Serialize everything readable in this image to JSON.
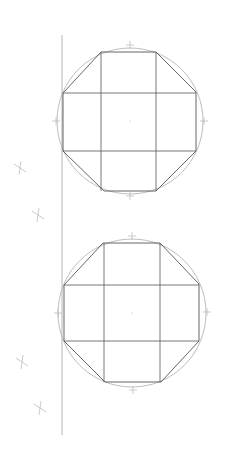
{
  "drawing": {
    "background": "#ffffff",
    "stroke_dark": "#555555",
    "stroke_light": "#b5b5b5",
    "baseline": {
      "x": 62,
      "y1": 35,
      "y2": 435
    },
    "figures": [
      {
        "name": "octagon-top",
        "center": [
          130,
          121
        ],
        "radius": 73,
        "octagon": [
          [
            101,
            52
          ],
          [
            156,
            52
          ],
          [
            196,
            92
          ],
          [
            196,
            151
          ],
          [
            156,
            191
          ],
          [
            104,
            191
          ],
          [
            63,
            151
          ],
          [
            63,
            93
          ]
        ],
        "inner_v": [
          101,
          156
        ],
        "inner_h": [
          93,
          151
        ],
        "ticks": [
          [
            130,
            45
          ],
          [
            130,
            196
          ],
          [
            56,
            121
          ],
          [
            204,
            121
          ]
        ]
      },
      {
        "name": "octagon-bottom",
        "center": [
          132,
          313
        ],
        "radius": 74,
        "octagon": [
          [
            103,
            243
          ],
          [
            160,
            243
          ],
          [
            199,
            284
          ],
          [
            199,
            341
          ],
          [
            161,
            382
          ],
          [
            105,
            382
          ],
          [
            64,
            341
          ],
          [
            64,
            285
          ]
        ],
        "inner_v": [
          104,
          160
        ],
        "inner_h": [
          285,
          341
        ],
        "ticks": [
          [
            132,
            236
          ],
          [
            133,
            390
          ],
          [
            58,
            313
          ],
          [
            207,
            312
          ]
        ]
      }
    ],
    "construction_marks": [
      [
        20,
        168
      ],
      [
        38,
        215
      ],
      [
        22,
        362
      ],
      [
        40,
        408
      ]
    ]
  }
}
